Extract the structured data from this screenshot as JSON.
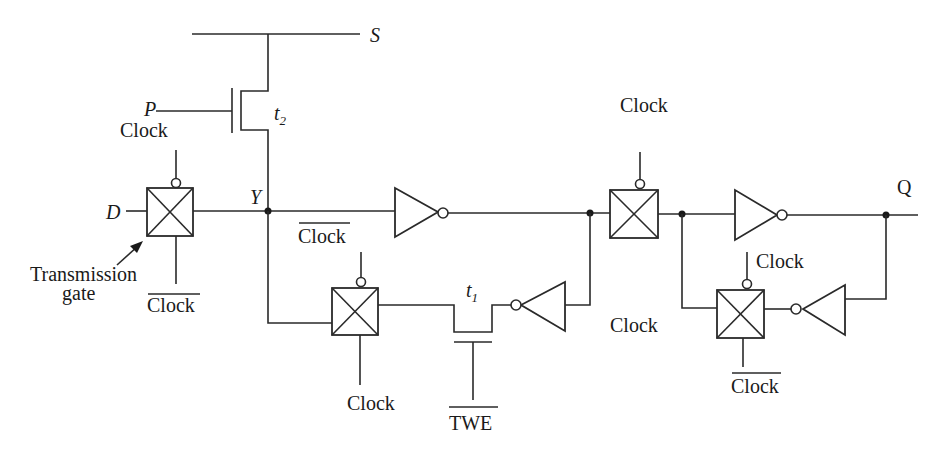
{
  "diagram": {
    "type": "circuit-schematic",
    "signals": {
      "s": "S",
      "p": "P",
      "d": "D",
      "y": "Y",
      "q": "Q",
      "twe": "TWE"
    },
    "transistors": {
      "t1": {
        "label": "t",
        "sub": "1"
      },
      "t2": {
        "label": "t",
        "sub": "2"
      }
    },
    "labels": {
      "tg1_top": "Clock",
      "tg1_bottom": "Clock",
      "tg3_top": "Clock",
      "tg3_bottom": "Clock",
      "tg2_top": "Clock",
      "tg2_bottom": "Clock",
      "tg4_top": "Clock",
      "tg4_bottom": "Clock",
      "annotation_line1": "Transmission",
      "annotation_line2": "gate"
    },
    "overlined": [
      "tg1_bottom",
      "tg3_top",
      "tg4_bottom",
      "twe"
    ],
    "components": [
      {
        "id": "tg1",
        "kind": "transmission-gate",
        "ctrl_top": "Clock",
        "ctrl_bottom": "Clock (inverted)"
      },
      {
        "id": "inv1",
        "kind": "inverter"
      },
      {
        "id": "tg2",
        "kind": "transmission-gate",
        "ctrl_top": "Clock",
        "ctrl_bottom": "Clock"
      },
      {
        "id": "inv3",
        "kind": "inverter"
      },
      {
        "id": "tg3",
        "kind": "transmission-gate",
        "ctrl_top": "Clock (inverted)",
        "ctrl_bottom": "Clock"
      },
      {
        "id": "t1",
        "kind": "nmos",
        "gate": "TWE (inverted)"
      },
      {
        "id": "inv2",
        "kind": "inverter"
      },
      {
        "id": "tg4",
        "kind": "transmission-gate",
        "ctrl_top": "Clock",
        "ctrl_bottom": "Clock (inverted)"
      },
      {
        "id": "inv4",
        "kind": "inverter"
      },
      {
        "id": "t2",
        "kind": "nmos",
        "gate": "P"
      }
    ]
  }
}
